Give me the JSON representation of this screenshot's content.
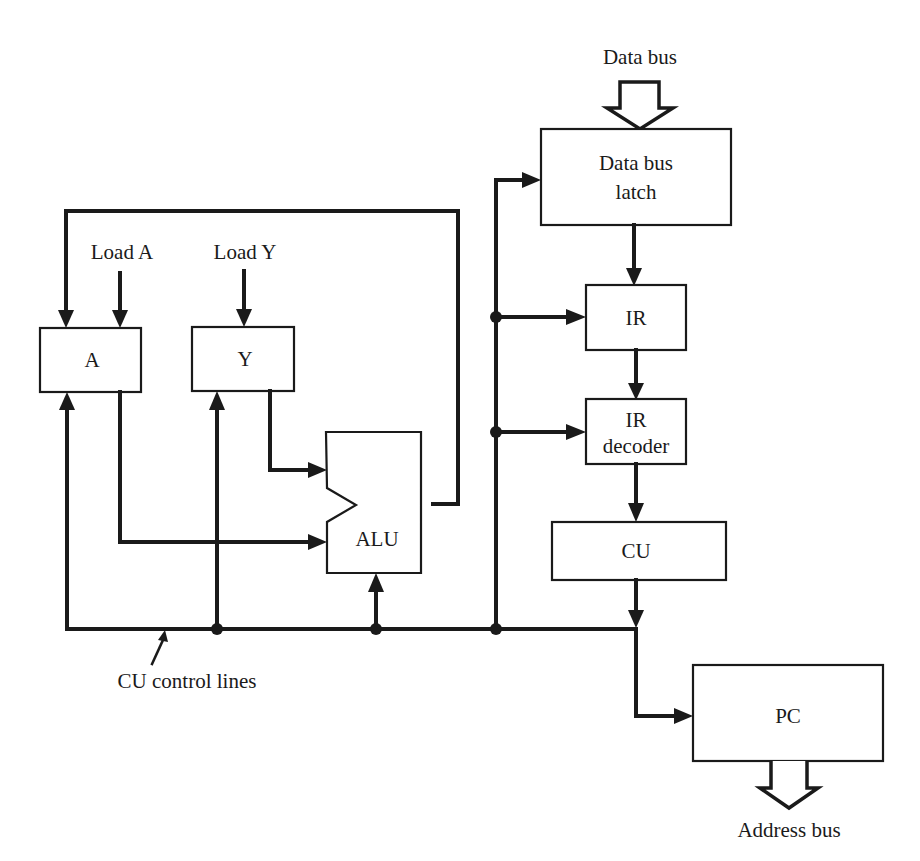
{
  "diagram": {
    "blocks": {
      "data_bus_latch": {
        "line1": "Data bus",
        "line2": "latch"
      },
      "ir": {
        "label": "IR"
      },
      "ir_decoder": {
        "line1": "IR",
        "line2": "decoder"
      },
      "cu": {
        "label": "CU"
      },
      "pc": {
        "label": "PC"
      },
      "reg_a": {
        "label": "A"
      },
      "reg_y": {
        "label": "Y"
      },
      "alu": {
        "label": "ALU"
      }
    },
    "signals": {
      "data_bus": "Data bus",
      "address_bus": "Address bus",
      "load_a": "Load A",
      "load_y": "Load Y",
      "cu_control_lines": "CU control lines"
    },
    "colors": {
      "line": "#1a1a1a",
      "background": "#ffffff"
    }
  }
}
